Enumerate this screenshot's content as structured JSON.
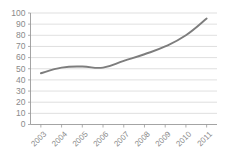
{
  "chart_data": {
    "type": "line",
    "title": "",
    "subtitle": "",
    "xlabel": "",
    "ylabel": "",
    "categories": [
      "2003",
      "2004",
      "2005",
      "2006",
      "2007",
      "2008",
      "2009",
      "2010",
      "2011"
    ],
    "values": [
      46,
      51,
      52,
      51,
      57,
      63,
      70,
      80,
      95
    ],
    "series": [
      {
        "name": "series-1",
        "color": "#7d7d7d",
        "values": [
          46,
          51,
          52,
          51,
          57,
          63,
          70,
          80,
          95
        ]
      }
    ],
    "ylim": [
      0,
      100
    ],
    "ytick_labels": [
      "0",
      "10",
      "20",
      "30",
      "40",
      "50",
      "60",
      "70",
      "80",
      "90",
      "100"
    ],
    "ytick_values": [
      0,
      10,
      20,
      30,
      40,
      50,
      60,
      70,
      80,
      90,
      100
    ],
    "xtick_labels": [
      "2003",
      "2004",
      "2005",
      "2006",
      "2007",
      "2008",
      "2009",
      "2010",
      "2011"
    ],
    "grid": true,
    "grid_axis": "y",
    "legend": false,
    "legend_position": "none",
    "annotations": [],
    "axis_color": "#9a9a9a",
    "grid_color": "#c9c9c9",
    "label_color": "#8a8a8a",
    "background_color": "#ffffff"
  },
  "plot": {
    "x_label_rotation": "-45"
  }
}
